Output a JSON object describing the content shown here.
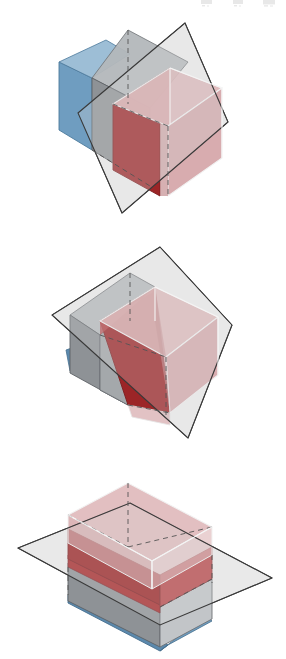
{
  "page": {
    "background_color": "#ffffff",
    "width": 286,
    "height": 659,
    "kind": "geometry-illustration-sequence"
  },
  "palette": {
    "blue_face": "#6f9dc0",
    "blue_face_dark": "#5b89ad",
    "gray_face": "#8e9296",
    "gray_face_light": "#b9bcbf",
    "gray_face_lighter": "#cfd2d4",
    "red_dark": "#9c2527",
    "red_mid": "#b8474a",
    "red_light": "#cf9a9d",
    "red_pale": "#ddb4b6",
    "plane_fill": "#eeeeee",
    "plane_stroke": "#3a3a3a",
    "edge_stroke": "#4a4a4a",
    "edge_white": "#f2f2f2",
    "dashed_stroke": "#555555",
    "artifact": "#e8e8e8"
  },
  "figures": [
    {
      "id": "figure-1",
      "name": "steep-plane-cut",
      "caption": "",
      "plane_orientation": "steep / near-vertical diagonal cut",
      "elements": [
        {
          "name": "cutting-plane",
          "role": "translucent gray quadrilateral plane"
        },
        {
          "name": "blue-slab-face",
          "role": "blue left face of lower region"
        },
        {
          "name": "gray-body",
          "role": "gray portion of box below plane"
        },
        {
          "name": "red-solid-wedge",
          "role": "dark red face of region above plane"
        },
        {
          "name": "red-translucent-box",
          "role": "pale red translucent box faces"
        },
        {
          "name": "hidden-edges",
          "role": "dashed hidden edges of the box"
        }
      ]
    },
    {
      "id": "figure-2",
      "name": "tilted-plane-cut",
      "caption": "",
      "plane_orientation": "moderately tilted diagonal cut",
      "elements": [
        {
          "name": "cutting-plane",
          "role": "translucent gray quadrilateral plane"
        },
        {
          "name": "blue-slab-face",
          "role": "small blue triangle of lower region"
        },
        {
          "name": "gray-body",
          "role": "gray portion of box below plane"
        },
        {
          "name": "red-solid-wedge",
          "role": "large dark red triangular wedge above plane"
        },
        {
          "name": "red-translucent-box",
          "role": "pale red translucent box faces"
        },
        {
          "name": "hidden-edges",
          "role": "dashed hidden edges of the box"
        }
      ]
    },
    {
      "id": "figure-3",
      "name": "horizontal-plane-cut",
      "caption": "",
      "plane_orientation": "horizontal cut",
      "elements": [
        {
          "name": "cutting-plane",
          "role": "translucent gray horizontal plane"
        },
        {
          "name": "blue-slab-face",
          "role": "blue base slab of the box"
        },
        {
          "name": "gray-body",
          "role": "gray lower portion of box below plane"
        },
        {
          "name": "red-solid-band",
          "role": "dark red horizontal band at the cut"
        },
        {
          "name": "red-translucent-box",
          "role": "pale red translucent upper box"
        },
        {
          "name": "hidden-edges",
          "role": "dashed hidden edges of the box"
        }
      ]
    }
  ],
  "artifacts": {
    "top_marks_label": "faint cut-off scan marks at page top",
    "count": 3
  }
}
